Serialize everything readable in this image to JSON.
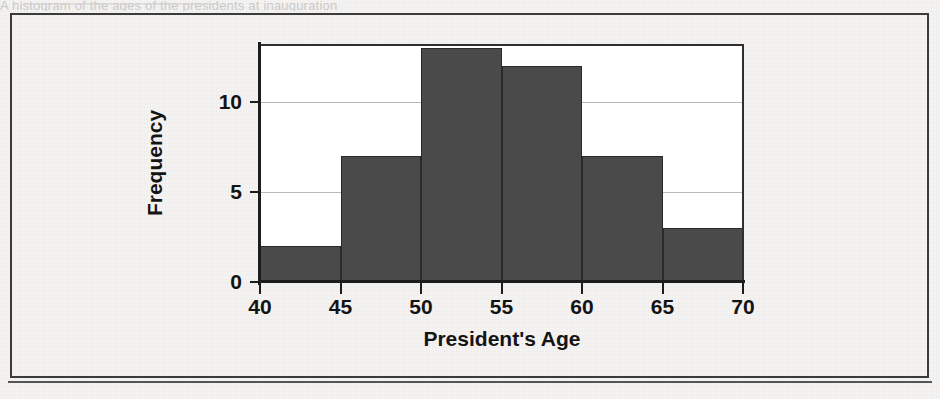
{
  "page": {
    "background_color": "#f4f3f1",
    "ghost_text_top": "A  histogram  of  the  ages  of  the  presidents  at  inauguration",
    "figure_border_color": "#3b3b3b"
  },
  "chart_data": {
    "type": "bar",
    "subtype": "histogram",
    "title": "",
    "xlabel": "President's Age",
    "ylabel": "Frequency",
    "categories": [
      "40-45",
      "45-50",
      "50-55",
      "55-60",
      "60-65",
      "65-70"
    ],
    "bin_edges": [
      40,
      45,
      50,
      55,
      60,
      65,
      70
    ],
    "values": [
      2,
      7,
      13,
      12,
      7,
      3
    ],
    "bin_width": 5,
    "xlim": [
      40,
      70
    ],
    "ylim": [
      0,
      13.2
    ],
    "xticks": [
      40,
      45,
      50,
      55,
      60,
      65,
      70
    ],
    "xtick_labels": [
      "40",
      "45",
      "50",
      "55",
      "60",
      "65",
      "70"
    ],
    "yticks": [
      0,
      5,
      10
    ],
    "ytick_labels": [
      "0",
      "5",
      "10"
    ],
    "grid": "horizontal",
    "gridline_color": "#b7b7b7",
    "legend": "none",
    "bar_color": "#4a4a4a",
    "bar_edge_color": "#2a2a2a",
    "axis_color": "#1d1d1d",
    "plot_background": "#ffffff"
  }
}
